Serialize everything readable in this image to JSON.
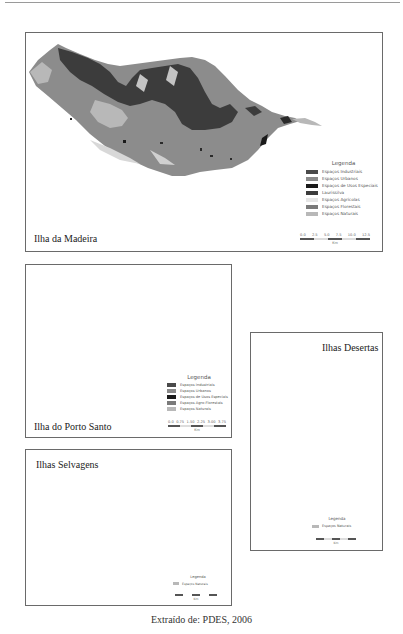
{
  "figure": {
    "caption": "Extraído de: PDES, 2006"
  },
  "panels": {
    "madeira": {
      "title": "Ilha da Madeira",
      "legend": {
        "title": "Legenda",
        "items": [
          {
            "label": "Espaços Industriais",
            "color": "#4a4a4a"
          },
          {
            "label": "Espaços Urbanos",
            "color": "#8a8a8a"
          },
          {
            "label": "Espaços de Usos Especiais",
            "color": "#1a1a1a"
          },
          {
            "label": "Laurissilva",
            "color": "#3c3c3c"
          },
          {
            "label": "Espaços Agrícolas",
            "color": "#e6e6e6"
          },
          {
            "label": "Espaços Florestais",
            "color": "#7a7a7a"
          },
          {
            "label": "Espaços Naturais",
            "color": "#b8b8b8"
          }
        ]
      },
      "scale": {
        "ticks": [
          "0.0",
          "2.5",
          "5.0",
          "7.5",
          "10.0",
          "12.5"
        ],
        "unit": "Km"
      }
    },
    "porto_santo": {
      "title": "Ilha do Porto Santo",
      "legend": {
        "title": "Legenda",
        "items": [
          {
            "label": "Espaços Industriais",
            "color": "#4a4a4a"
          },
          {
            "label": "Espaços Urbanos",
            "color": "#8a8a8a"
          },
          {
            "label": "Espaços de Usos Especiais",
            "color": "#1a1a1a"
          },
          {
            "label": "Espaços Agro-Florestais",
            "color": "#7a7a7a"
          },
          {
            "label": "Espaços Naturais",
            "color": "#b8b8b8"
          }
        ]
      },
      "scale": {
        "ticks": [
          "0.0",
          "0.75",
          "1.50",
          "2.25",
          "3.00",
          "3.75"
        ],
        "unit": "Km"
      }
    },
    "desertas": {
      "title": "Ilhas Desertas",
      "legend": {
        "title": "Legenda",
        "items": [
          {
            "label": "Espaços Naturais",
            "color": "#b8b8b8"
          }
        ]
      },
      "scale": {
        "unit": "Km"
      }
    },
    "selvagens": {
      "title": "Ilhas Selvagens",
      "legend": {
        "title": "Legenda",
        "items": [
          {
            "label": "Espaços Naturais",
            "color": "#b8b8b8"
          }
        ]
      },
      "scale": {
        "unit": "Km"
      }
    }
  },
  "colors": {
    "border": "#6a6a6a",
    "land_base": "#8c8c8c",
    "laurissilva": "#3c3c3c",
    "natural": "#b8b8b8"
  }
}
